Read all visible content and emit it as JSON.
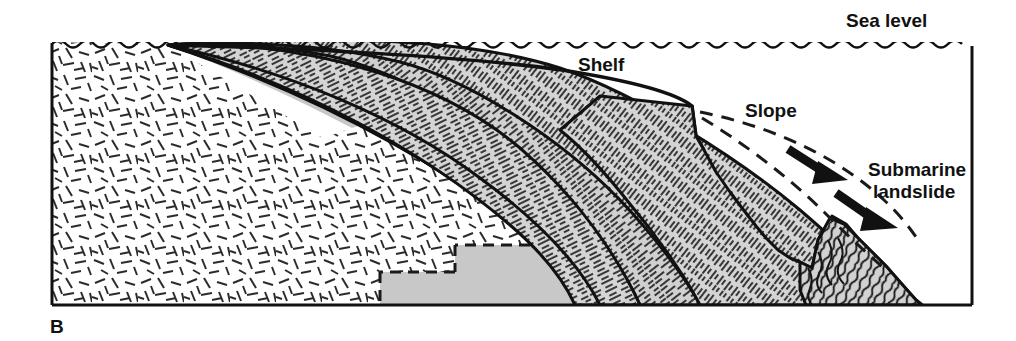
{
  "figure": {
    "panel_letter": "B",
    "type": "geologic-cross-section",
    "title_labels": {
      "sea_level": "Sea level",
      "shelf": "Shelf",
      "slope": "Slope",
      "submarine_landslide": "Submarine landslide",
      "submarine_landslide_line1": "Submarine",
      "submarine_landslide_line2": "landslide"
    },
    "colors": {
      "ink": "#111111",
      "sediment_gray": "#d2d2d2",
      "wedge_gray": "#c8c8c8",
      "basement_white": "#ffffff",
      "background": "#ffffff"
    },
    "frame": {
      "left": 52,
      "top": 42,
      "right": 972,
      "bottom": 305
    },
    "units": {
      "basement": "crystalline basement (random dash pattern)",
      "wedge": "older sedimentary wedge (plain gray)",
      "strata": "prograding shelf strata (dashed bedding)",
      "landslide": "slump / landslide deposit (contorted bedding)"
    },
    "annotations": {
      "sea_level_line": "wavy line at top of frame",
      "slope_arc": "dashed arc from shelf break down the slope",
      "transport_arrows": 2,
      "fault_blocks": 4
    }
  }
}
